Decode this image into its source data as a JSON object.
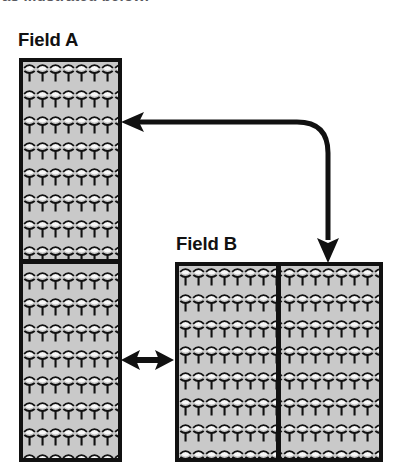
{
  "caption": {
    "partial_text_top": "as illustrated below."
  },
  "figure": {
    "background_color": "#ffffff",
    "stroke_color": "#111111",
    "field_fill_color": "#c9c9c9",
    "fields": [
      {
        "id": "field-a",
        "label": "Field A",
        "shape": "tall-rectangle",
        "divider": "horizontal",
        "subplots": 2,
        "crop_texture": "crop-plant-rows"
      },
      {
        "id": "field-b",
        "label": "Field B",
        "shape": "square",
        "divider": "vertical",
        "subplots": 2,
        "crop_texture": "crop-plant-rows"
      }
    ],
    "arrows": [
      {
        "id": "rotation-arrow",
        "type": "elbow-curved",
        "heads": "both-ends",
        "from": "field-b-top",
        "to": "field-a-upper-right"
      },
      {
        "id": "exchange-arrow",
        "type": "straight-horizontal",
        "heads": "both-ends",
        "from": "field-a",
        "to": "field-b"
      }
    ]
  }
}
